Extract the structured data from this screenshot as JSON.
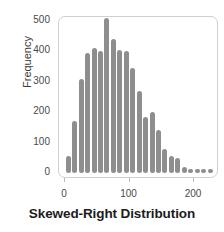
{
  "chart_data": {
    "type": "bar",
    "title": "Skewed-Right Distribution",
    "xlabel": "",
    "ylabel": "Frequency",
    "xlim": [
      -5,
      245
    ],
    "ylim": [
      0,
      530
    ],
    "grid": false,
    "legend": "none",
    "bar_color": "#8e8e8e",
    "frame_color": "#cfcfcf",
    "tick_color": "#b9b9b9",
    "x_ticks": [
      {
        "value": 0,
        "label": "0"
      },
      {
        "value": 100,
        "label": "100"
      },
      {
        "value": 200,
        "label": "200"
      }
    ],
    "y_ticks": [
      {
        "value": 0,
        "label": "0"
      },
      {
        "value": 100,
        "label": "100"
      },
      {
        "value": 200,
        "label": "200"
      },
      {
        "value": 300,
        "label": "300"
      },
      {
        "value": 400,
        "label": "400"
      },
      {
        "value": 500,
        "label": "500"
      }
    ],
    "bin_width": 10,
    "categories": [
      5,
      15,
      25,
      35,
      45,
      55,
      65,
      75,
      85,
      95,
      105,
      115,
      125,
      135,
      145,
      155,
      165,
      175,
      185,
      195,
      205,
      215,
      225
    ],
    "values": [
      55,
      170,
      310,
      395,
      410,
      400,
      510,
      440,
      405,
      400,
      345,
      270,
      185,
      200,
      140,
      80,
      55,
      50,
      20,
      10,
      10,
      10,
      10
    ]
  }
}
